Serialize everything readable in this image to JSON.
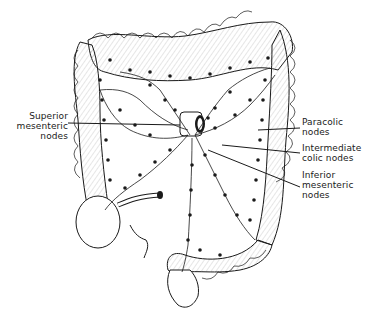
{
  "diagram": {
    "colors": {
      "ink": "#1a1a1a",
      "background": "#ffffff",
      "fill": "#ffffff",
      "hatch": "#7a7a7a"
    },
    "labels": [
      {
        "id": "superior-mesenteric-nodes",
        "line1": "Superior",
        "line2": "mesenteric",
        "line3": "nodes"
      },
      {
        "id": "paracolic-nodes",
        "line1": "Paracolic",
        "line2": "nodes"
      },
      {
        "id": "intermediate-colic-nodes",
        "line1": "Intermediate",
        "line2": "colic nodes"
      },
      {
        "id": "inferior-mesenteric-nodes",
        "line1": "Inferior",
        "line2": "mesenteric",
        "line3": "nodes"
      }
    ]
  }
}
